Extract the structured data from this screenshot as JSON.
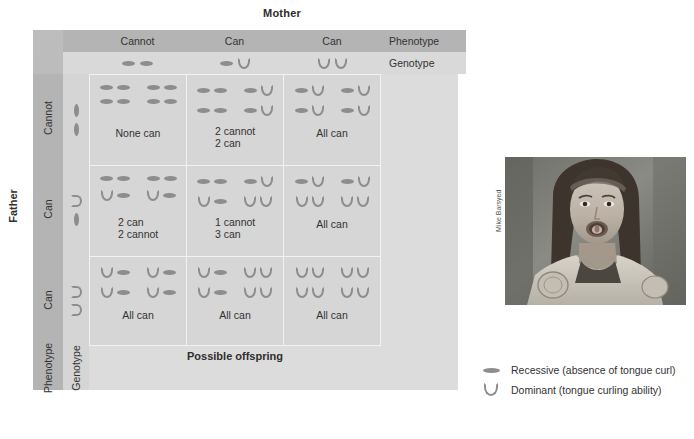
{
  "figure": {
    "mother_title": "Mother",
    "father_title": "Father",
    "possible_offspring": "Possible offspring",
    "right_labels": {
      "phenotype": "Phenotype",
      "genotype": "Genotype"
    },
    "bottom_labels": {
      "phenotype": "Phenotype",
      "genotype": "Genotype"
    }
  },
  "colors": {
    "frame": "#b4b4b4",
    "panel": "#dcdcdc",
    "cell": "#d6d6d6",
    "allele": "#8d8d8d",
    "grid_line": "#f2f2f2",
    "text": "#333333"
  },
  "mother": {
    "columns": [
      {
        "phenotype": "Cannot",
        "genotype": [
          "recessive",
          "recessive"
        ]
      },
      {
        "phenotype": "Can",
        "genotype": [
          "recessive",
          "dominant"
        ]
      },
      {
        "phenotype": "Can",
        "genotype": [
          "dominant",
          "dominant"
        ]
      }
    ]
  },
  "father": {
    "rows": [
      {
        "phenotype": "Cannot",
        "genotype": [
          "recessive",
          "recessive"
        ]
      },
      {
        "phenotype": "Can",
        "genotype": [
          "dominant",
          "recessive"
        ]
      },
      {
        "phenotype": "Can",
        "genotype": [
          "dominant",
          "dominant"
        ]
      }
    ]
  },
  "punnett": {
    "cells": [
      {
        "row": 0,
        "col": 0,
        "verdict": "None can",
        "verdict_lines": [
          "None can"
        ],
        "offspring": [
          [
            "recessive",
            "recessive"
          ],
          [
            "recessive",
            "recessive"
          ],
          [
            "recessive",
            "recessive"
          ],
          [
            "recessive",
            "recessive"
          ]
        ]
      },
      {
        "row": 0,
        "col": 1,
        "verdict": "2 cannot 2 can",
        "verdict_lines": [
          "2 cannot",
          "2 can"
        ],
        "offspring": [
          [
            "recessive",
            "recessive"
          ],
          [
            "recessive",
            "dominant"
          ],
          [
            "recessive",
            "recessive"
          ],
          [
            "recessive",
            "dominant"
          ]
        ]
      },
      {
        "row": 0,
        "col": 2,
        "verdict": "All can",
        "verdict_lines": [
          "All can"
        ],
        "offspring": [
          [
            "recessive",
            "dominant"
          ],
          [
            "recessive",
            "dominant"
          ],
          [
            "recessive",
            "dominant"
          ],
          [
            "recessive",
            "dominant"
          ]
        ]
      },
      {
        "row": 1,
        "col": 0,
        "verdict": "2 can 2 cannot",
        "verdict_lines": [
          "2 can",
          "2 cannot"
        ],
        "offspring": [
          [
            "recessive",
            "recessive"
          ],
          [
            "recessive",
            "recessive"
          ],
          [
            "dominant",
            "recessive"
          ],
          [
            "dominant",
            "recessive"
          ]
        ]
      },
      {
        "row": 1,
        "col": 1,
        "verdict": "1 cannot 3 can",
        "verdict_lines": [
          "1 cannot",
          "3 can"
        ],
        "offspring": [
          [
            "recessive",
            "recessive"
          ],
          [
            "recessive",
            "dominant"
          ],
          [
            "dominant",
            "recessive"
          ],
          [
            "dominant",
            "dominant"
          ]
        ]
      },
      {
        "row": 1,
        "col": 2,
        "verdict": "All can",
        "verdict_lines": [
          "All can"
        ],
        "offspring": [
          [
            "recessive",
            "dominant"
          ],
          [
            "recessive",
            "dominant"
          ],
          [
            "dominant",
            "dominant"
          ],
          [
            "dominant",
            "dominant"
          ]
        ]
      },
      {
        "row": 2,
        "col": 0,
        "verdict": "All can",
        "verdict_lines": [
          "All can"
        ],
        "offspring": [
          [
            "dominant",
            "recessive"
          ],
          [
            "dominant",
            "recessive"
          ],
          [
            "dominant",
            "recessive"
          ],
          [
            "dominant",
            "recessive"
          ]
        ]
      },
      {
        "row": 2,
        "col": 1,
        "verdict": "All can",
        "verdict_lines": [
          "All can"
        ],
        "offspring": [
          [
            "dominant",
            "recessive"
          ],
          [
            "dominant",
            "dominant"
          ],
          [
            "dominant",
            "recessive"
          ],
          [
            "dominant",
            "dominant"
          ]
        ]
      },
      {
        "row": 2,
        "col": 2,
        "verdict": "All can",
        "verdict_lines": [
          "All can"
        ],
        "offspring": [
          [
            "dominant",
            "dominant"
          ],
          [
            "dominant",
            "dominant"
          ],
          [
            "dominant",
            "dominant"
          ],
          [
            "dominant",
            "dominant"
          ]
        ]
      }
    ]
  },
  "legend": {
    "items": [
      {
        "symbol": "recessive",
        "label": "Recessive (absence of tongue curl)"
      },
      {
        "symbol": "dominant",
        "label": "Dominant (tongue curling ability)"
      }
    ]
  },
  "photo": {
    "credit": "Mike Barsyed",
    "alt": "Person curling tongue"
  }
}
